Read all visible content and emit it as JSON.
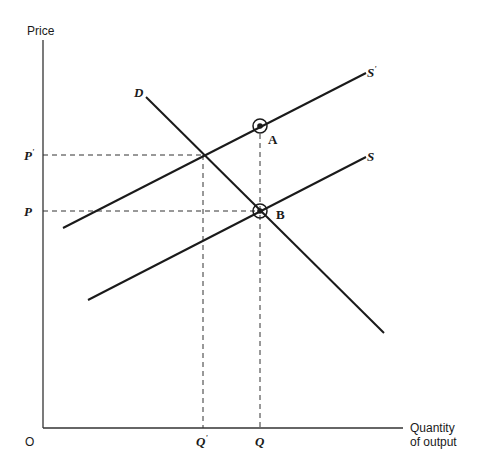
{
  "diagram": {
    "type": "supply-demand",
    "axes": {
      "y_label": "Price",
      "x_label_line1": "Quantity",
      "x_label_line2": "of output",
      "origin_label": "O"
    },
    "price_levels": [
      {
        "label": "P'",
        "base": "P",
        "mark": "'",
        "y": 155
      },
      {
        "label": "P",
        "base": "P",
        "mark": "",
        "y": 211
      }
    ],
    "quantity_levels": [
      {
        "label": "Q'",
        "base": "Q",
        "mark": "'",
        "x": 203
      },
      {
        "label": "Q",
        "base": "Q",
        "mark": "",
        "x": 260
      }
    ],
    "curves": [
      {
        "name": "S'",
        "label_base": "S",
        "label_mark": "'",
        "kind": "supply-shifted",
        "x1": 63,
        "y1": 228,
        "x2": 366,
        "y2": 73
      },
      {
        "name": "S",
        "label_base": "S",
        "label_mark": "",
        "kind": "supply",
        "x1": 88,
        "y1": 300,
        "x2": 366,
        "y2": 157
      },
      {
        "name": "D",
        "label_base": "D",
        "label_mark": "",
        "kind": "demand",
        "x1": 146,
        "y1": 97,
        "x2": 384,
        "y2": 333
      }
    ],
    "points": [
      {
        "label": "A",
        "x": 260,
        "y": 126
      },
      {
        "label": "B",
        "x": 260,
        "y": 211
      }
    ],
    "colors": {
      "line": "#1a1a1a",
      "axis": "#333333",
      "background": "#ffffff"
    }
  }
}
